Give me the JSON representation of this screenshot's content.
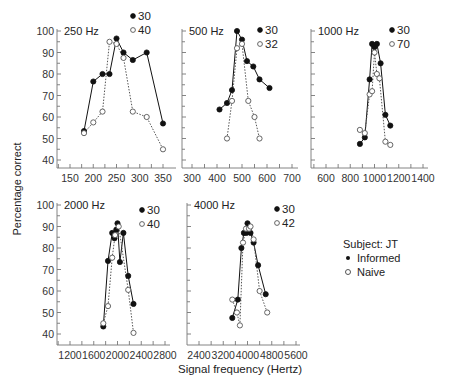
{
  "chart_data": {
    "type": "line",
    "title": "",
    "xlabel": "Signal frequency (Hertz)",
    "ylabel": "Percentage correct",
    "legend": {
      "title": "Subject:  JT",
      "entries": [
        {
          "name": "Informed",
          "marker": "filled-circle"
        },
        {
          "name": "Naive",
          "marker": "open-circle"
        }
      ]
    },
    "panels": [
      {
        "title": "250 Hz",
        "xlim": [
          130,
          360
        ],
        "ylim": [
          35,
          100
        ],
        "xticks": [
          150,
          200,
          250,
          300,
          350
        ],
        "yticks": [
          40,
          50,
          60,
          70,
          80,
          90,
          100
        ],
        "series": [
          {
            "name": "Informed",
            "label": "30",
            "x": [
              180,
              200,
              220,
              235,
              250,
              265,
              285,
              315,
              350
            ],
            "y": [
              53.5,
              76.5,
              80,
              80,
              96.5,
              90,
              86.5,
              90,
              57
            ]
          },
          {
            "name": "Naive",
            "label": "40",
            "x": [
              180,
              200,
              220,
              235,
              250,
              265,
              285,
              315,
              350
            ],
            "y": [
              52.5,
              57.5,
              62.5,
              95,
              94,
              87.5,
              62.5,
              60,
              45
            ]
          }
        ]
      },
      {
        "title": "500 Hz",
        "xlim": [
          260,
          720
        ],
        "ylim": [
          35,
          100
        ],
        "xticks": [
          300,
          400,
          500,
          600,
          700
        ],
        "yticks": [
          40,
          50,
          60,
          70,
          80,
          90,
          100
        ],
        "series": [
          {
            "name": "Informed",
            "label": "30",
            "x": [
              410,
              440,
              460,
              480,
              500,
              520,
              545,
              570,
              610
            ],
            "y": [
              63.5,
              66.5,
              72.5,
              100,
              96,
              86,
              83.5,
              77.5,
              73.5
            ]
          },
          {
            "name": "Naive",
            "label": "32",
            "x": [
              440,
              460,
              480,
              500,
              525,
              550,
              570
            ],
            "y": [
              50,
              67.5,
              92,
              94,
              67.5,
              60,
              50
            ]
          }
        ]
      },
      {
        "title": "1000 Hz",
        "xlim": [
          480,
          1450
        ],
        "ylim": [
          35,
          100
        ],
        "xticks": [
          600,
          800,
          1000,
          1200,
          1400
        ],
        "yticks": [
          40,
          50,
          60,
          70,
          80,
          90,
          100
        ],
        "series": [
          {
            "name": "Informed",
            "label": "30",
            "x": [
              880,
              920,
              960,
              980,
              1000,
              1020,
              1050,
              1090,
              1130
            ],
            "y": [
              47.5,
              50.5,
              77.5,
              94,
              92.5,
              94,
              85,
              61,
              56
            ]
          },
          {
            "name": "Naive",
            "label": "70",
            "x": [
              880,
              920,
              960,
              980,
              1000,
              1020,
              1040,
              1090,
              1130
            ],
            "y": [
              54,
              52.5,
              70.5,
              72,
              90,
              80,
              78,
              48.5,
              47
            ]
          }
        ]
      },
      {
        "title": "2000 Hz",
        "xlim": [
          980,
          2850
        ],
        "ylim": [
          35,
          100
        ],
        "xticks": [
          1200,
          1600,
          2000,
          2400,
          2800
        ],
        "yticks": [
          40,
          50,
          60,
          70,
          80,
          90,
          100
        ],
        "series": [
          {
            "name": "Informed",
            "label": "30",
            "x": [
              1760,
              1840,
              1910,
              1950,
              1980,
              2000,
              2040,
              2100,
              2180,
              2270
            ],
            "y": [
              43.5,
              74,
              87,
              84.5,
              88.5,
              91.5,
              73.5,
              87,
              67,
              54
            ]
          },
          {
            "name": "Naive",
            "label": "40",
            "x": [
              1760,
              1840,
              1910,
              1960,
              2020,
              2180,
              2270
            ],
            "y": [
              45,
              53,
              75.5,
              86,
              90,
              60.5,
              40.5
            ]
          }
        ]
      },
      {
        "title": "4000 Hz",
        "xlim": [
          2000,
          5800
        ],
        "ylim": [
          35,
          100
        ],
        "xticks": [
          2400,
          3200,
          4000,
          4800,
          5600
        ],
        "yticks": [
          40,
          50,
          60,
          70,
          80,
          90,
          100
        ],
        "series": [
          {
            "name": "Informed",
            "label": "30",
            "x": [
              3500,
              3680,
              3800,
              3880,
              3960,
              4000,
              4100,
              4200,
              4350,
              4600
            ],
            "y": [
              47.5,
              56,
              80,
              87,
              87,
              91.5,
              87,
              82.5,
              72,
              58.5
            ]
          },
          {
            "name": "Naive",
            "label": "42",
            "x": [
              3500,
              3650,
              3750,
              3850,
              3950,
              4050,
              4100,
              4200,
              4400,
              4650
            ],
            "y": [
              56,
              50,
              44,
              82.5,
              89,
              89,
              90,
              84,
              60,
              50
            ]
          }
        ]
      }
    ]
  },
  "labels": {
    "ylabel": "Percentage correct",
    "xlabel": "Signal frequency (Hertz)",
    "legend_title": "Subject:  JT",
    "legend_informed": "Informed",
    "legend_naive": "Naive"
  }
}
